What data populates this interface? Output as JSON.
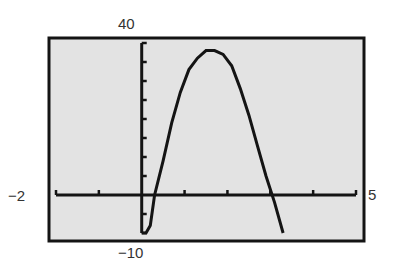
{
  "window_labels": {
    "ymax": "40",
    "ymin": "−10",
    "xmin": "−2",
    "xmax": "5"
  },
  "colors": {
    "screen_bg": "#e3e3e3",
    "frame": "#141414",
    "curve": "#141414",
    "axis": "#141414",
    "page_bg": "#ffffff"
  },
  "chart_data": {
    "type": "line",
    "title": "",
    "xlabel": "",
    "ylabel": "",
    "xlim": [
      -2,
      5
    ],
    "ylim": [
      -10,
      40
    ],
    "xscl": 1,
    "yscl": 5,
    "grid": false,
    "legend": null,
    "series": [
      {
        "name": "graph",
        "x": [
          0.0,
          0.1,
          0.2,
          0.3,
          0.5,
          0.7,
          0.9,
          1.1,
          1.3,
          1.5,
          1.7,
          1.9,
          2.1,
          2.3,
          2.5,
          2.7,
          2.9,
          3.1,
          3.3
        ],
        "y": [
          -10,
          -10,
          -8,
          0,
          9,
          19,
          27,
          33,
          36,
          38,
          38,
          37,
          34,
          28,
          21,
          13,
          5,
          -2,
          -10
        ]
      }
    ],
    "annotations": [
      "40",
      "−10",
      "−2",
      "5"
    ]
  }
}
